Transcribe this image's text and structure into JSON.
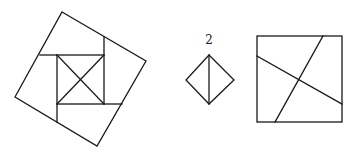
{
  "figures": {
    "pinwheel": {
      "description": "Tilted outer square dissected around a central axis-aligned square with both diagonals",
      "outer_square": [
        [
          62,
          12
        ],
        [
          146,
          61
        ],
        [
          97,
          146
        ],
        [
          15,
          97
        ]
      ],
      "inner_square": {
        "x1": 57,
        "y1": 55,
        "x2": 104,
        "y2": 104
      },
      "extension_lines": [
        [
          [
            40,
            55
          ],
          [
            57,
            55
          ]
        ],
        [
          [
            104,
            37
          ],
          [
            104,
            55
          ]
        ],
        [
          [
            104,
            104
          ],
          [
            122,
            104
          ]
        ],
        [
          [
            57,
            104
          ],
          [
            57,
            122
          ]
        ]
      ],
      "diagonals": [
        [
          [
            57,
            55
          ],
          [
            104,
            104
          ]
        ],
        [
          [
            104,
            55
          ],
          [
            57,
            104
          ]
        ]
      ]
    },
    "diamond": {
      "label": "2",
      "label_pos": [
        209,
        44
      ],
      "vertices": [
        [
          209,
          55
        ],
        [
          234,
          80
        ],
        [
          209,
          104
        ],
        [
          186,
          80
        ]
      ],
      "divider": [
        [
          209,
          55
        ],
        [
          209,
          104
        ]
      ]
    },
    "cut_square": {
      "square": {
        "x1": 257,
        "y1": 36,
        "x2": 342,
        "y2": 122
      },
      "cuts": [
        [
          [
            257,
            56
          ],
          [
            342,
            104
          ]
        ],
        [
          [
            323,
            36
          ],
          [
            275,
            122
          ]
        ]
      ]
    }
  },
  "colors": {
    "stroke": "#1a1a1a",
    "background": "#ffffff"
  }
}
